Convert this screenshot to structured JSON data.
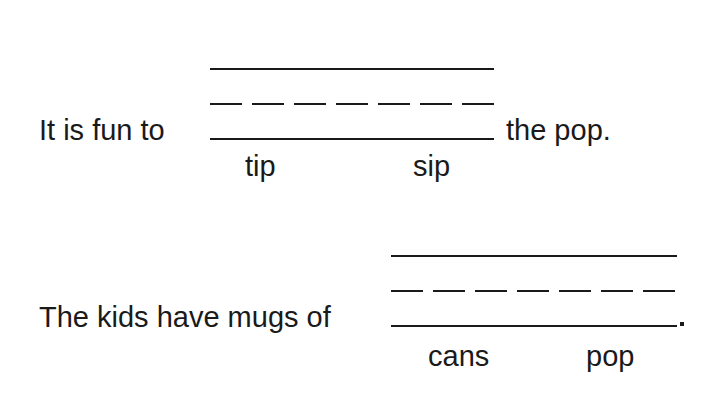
{
  "worksheet": {
    "items": [
      {
        "before": "It is fun to",
        "after": "the pop.",
        "choices": [
          "tip",
          "sip"
        ]
      },
      {
        "before": "The kids have mugs of",
        "after": ".",
        "choices": [
          "cans",
          "pop"
        ]
      }
    ]
  }
}
